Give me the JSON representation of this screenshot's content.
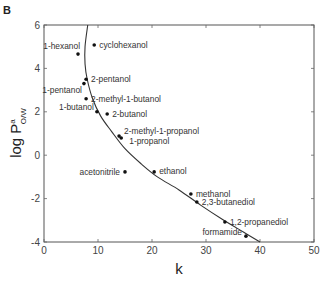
{
  "panel_label": "B",
  "chart_data": {
    "type": "scatter",
    "title": "",
    "xlabel": "k",
    "ylabel": "log P",
    "ylabel_superscript": "a",
    "ylabel_subscript": "O/W",
    "xlim": [
      0,
      50
    ],
    "ylim": [
      -4,
      6
    ],
    "xticks": [
      0,
      10,
      20,
      30,
      40,
      50
    ],
    "yticks": [
      -4,
      -2,
      0,
      2,
      4,
      6
    ],
    "grid": false,
    "legend": null,
    "points": [
      {
        "name": "1-hexanol",
        "k": 6.3,
        "logP": 4.66,
        "label_pos": "left"
      },
      {
        "name": "cyclohexanol",
        "k": 9.3,
        "logP": 5.08,
        "label_pos": "right"
      },
      {
        "name": "2-pentanol",
        "k": 7.8,
        "logP": 3.5,
        "label_pos": "right"
      },
      {
        "name": "1-pentanol",
        "k": 7.4,
        "logP": 3.3,
        "label_pos": "left-below"
      },
      {
        "name": "2-methyl-1-butanol",
        "k": 7.8,
        "logP": 2.6,
        "label_pos": "right"
      },
      {
        "name": "1-butanol",
        "k": 9.8,
        "logP": 2.0,
        "label_pos": "left"
      },
      {
        "name": "2-butanol",
        "k": 11.7,
        "logP": 1.9,
        "label_pos": "right"
      },
      {
        "name": "2-methyl-1-propanol",
        "k": 13.9,
        "logP": 0.88,
        "label_pos": "right-above"
      },
      {
        "name": "1-propanol",
        "k": 14.3,
        "logP": 0.79,
        "label_pos": "right-below"
      },
      {
        "name": "acetonitrile",
        "k": 15.0,
        "logP": -0.77,
        "label_pos": "left"
      },
      {
        "name": "ethanol",
        "k": 20.4,
        "logP": -0.77,
        "label_pos": "right"
      },
      {
        "name": "methanol",
        "k": 27.2,
        "logP": -1.79,
        "label_pos": "right"
      },
      {
        "name": "2,3-butanediol",
        "k": 28.3,
        "logP": -2.16,
        "label_pos": "right"
      },
      {
        "name": "1,2-propanediol",
        "k": 33.5,
        "logP": -3.08,
        "label_pos": "right"
      },
      {
        "name": "formamide",
        "k": 37.4,
        "logP": -3.73,
        "label_pos": "left"
      }
    ],
    "fit_curve": {
      "description": "smooth fitted curve",
      "points": [
        [
          8.1,
          6.0
        ],
        [
          7.6,
          5.0
        ],
        [
          7.6,
          4.2
        ],
        [
          8.0,
          3.5
        ],
        [
          9.0,
          2.6
        ],
        [
          10.5,
          1.8
        ],
        [
          12.5,
          1.1
        ],
        [
          15.0,
          0.3
        ],
        [
          18.0,
          -0.4
        ],
        [
          21.0,
          -1.0
        ],
        [
          25.0,
          -1.6
        ],
        [
          29.0,
          -2.3
        ],
        [
          33.0,
          -2.95
        ],
        [
          37.0,
          -3.55
        ],
        [
          40.0,
          -4.0
        ]
      ]
    }
  }
}
